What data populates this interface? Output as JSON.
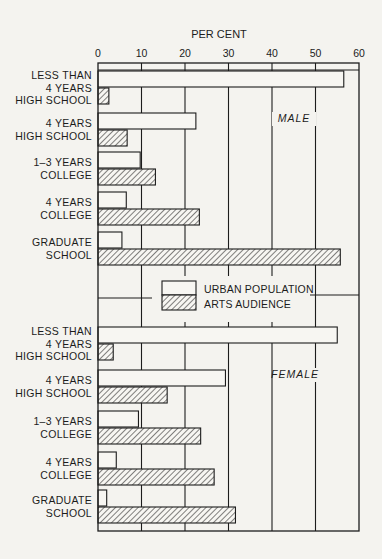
{
  "chart_data": {
    "type": "bar",
    "orientation": "horizontal",
    "title": "",
    "xlabel": "PER CENT",
    "ylabel": "",
    "xlim": [
      0,
      60
    ],
    "x_ticks": [
      0,
      10,
      20,
      30,
      40,
      50,
      60
    ],
    "grid": true,
    "legend": {
      "position": "center-between-panels",
      "entries": [
        {
          "name": "URBAN POPULATION",
          "pattern": "plain"
        },
        {
          "name": "ARTS AUDIENCE",
          "pattern": "hatched"
        }
      ]
    },
    "categories": [
      [
        "LESS THAN",
        "4 YEARS",
        "HIGH SCHOOL"
      ],
      [
        "4 YEARS",
        "HIGH SCHOOL"
      ],
      [
        "1–3 YEARS",
        "COLLEGE"
      ],
      [
        "4 YEARS",
        "COLLEGE"
      ],
      [
        "GRADUATE",
        "SCHOOL"
      ]
    ],
    "panels": [
      {
        "label": "MALE",
        "series": [
          {
            "name": "URBAN POPULATION",
            "values": [
              56.5,
              22.5,
              9.7,
              6.5,
              5.5
            ]
          },
          {
            "name": "ARTS AUDIENCE",
            "values": [
              2.5,
              6.7,
              13.2,
              23.3,
              55.7
            ]
          }
        ]
      },
      {
        "label": "FEMALE",
        "series": [
          {
            "name": "URBAN POPULATION",
            "values": [
              55.0,
              29.3,
              9.3,
              4.2,
              2.0
            ]
          },
          {
            "name": "ARTS AUDIENCE",
            "values": [
              3.5,
              15.9,
              23.6,
              26.7,
              31.6
            ]
          }
        ]
      }
    ]
  },
  "colors": {
    "background": "#f4f3ef",
    "ink": "#1c1c1c",
    "bar_fill": "#f7f6f2"
  }
}
